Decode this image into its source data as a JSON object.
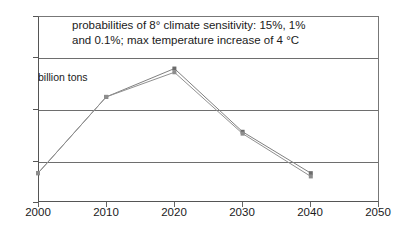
{
  "chart_data": {
    "type": "line",
    "title": "probabilities of 8° climate sensitivity: 15%, 1% and 0.1%;  max temperature increase of 4 °C",
    "title_lines": [
      "probabilities of 8° climate sensitivity: 15%, 1%",
      "and 0.1%;  max temperature increase of 4 °C"
    ],
    "xlabel": "",
    "ylabel": "billion tons",
    "x": [
      2000,
      2010,
      2020,
      2030,
      2040
    ],
    "xlim": [
      2000,
      2050
    ],
    "ylim": [
      6,
      10
    ],
    "x_ticks": [
      "2000",
      "2010",
      "2020",
      "2030",
      "2040",
      "2050"
    ],
    "x_tick_values": [
      2000,
      2010,
      2020,
      2030,
      2040,
      2050
    ],
    "y_ticks": [
      "6",
      "7",
      "8",
      "9",
      "10"
    ],
    "y_tick_values": [
      6,
      7,
      8,
      9,
      10
    ],
    "grid": "horizontal",
    "legend": "none",
    "series": [
      {
        "name": "series-1",
        "color": "#808080",
        "marker": "square",
        "values": [
          6.62,
          8.26,
          8.87,
          7.51,
          6.62
        ]
      },
      {
        "name": "series-2",
        "color": "#909090",
        "marker": "square",
        "values": [
          6.62,
          8.26,
          8.79,
          7.47,
          6.55
        ]
      }
    ],
    "annotations": [
      {
        "name": "units-label",
        "text": "billion tons"
      }
    ]
  },
  "axes": {
    "y_axis_name": "emissions-axis",
    "x_axis_name": "year-axis"
  },
  "colors": {
    "grid": "#6e6e6e",
    "frame": "#555555",
    "series_1": "#808080",
    "series_2": "#909090",
    "text": "#1a1a1a",
    "background": "#ffffff"
  }
}
